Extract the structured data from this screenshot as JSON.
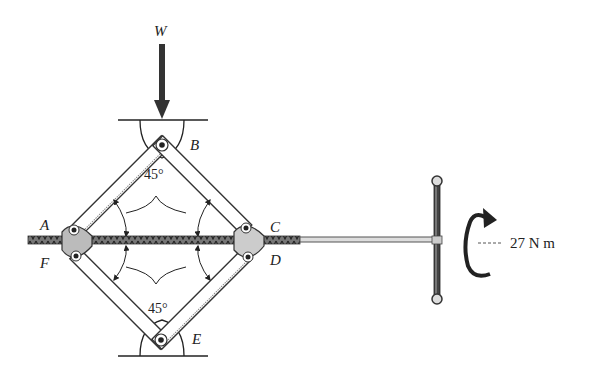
{
  "figure": {
    "labels": {
      "load": "W",
      "joint_top": "B",
      "joint_left_upper": "A",
      "joint_left_lower": "F",
      "joint_right_upper": "C",
      "joint_right_lower": "D",
      "joint_bottom": "E"
    },
    "angles": {
      "top": "45°",
      "bottom": "45°"
    },
    "moment": {
      "label": "27 N m",
      "value": 27,
      "unit": "N m",
      "direction": "counterclockwise-arrow"
    },
    "colors": {
      "ink": "#222222",
      "link_fill": "#ffffff",
      "screw": "#555555",
      "background": "#ffffff"
    }
  }
}
